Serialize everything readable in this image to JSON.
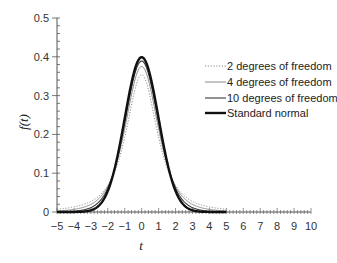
{
  "chart_data": {
    "type": "line",
    "title": "",
    "xlabel": "t",
    "ylabel": "f(t)",
    "xlim": [
      -5,
      10
    ],
    "ylim": [
      0,
      0.5
    ],
    "x_ticks": [
      "-5",
      "-4",
      "-3",
      "-2",
      "-1",
      "0",
      "1",
      "2",
      "3",
      "4",
      "5",
      "6",
      "7",
      "8",
      "9",
      "10"
    ],
    "y_ticks": [
      "0",
      "0.1",
      "0.2",
      "0.3",
      "0.4",
      "0.5"
    ],
    "grid": false,
    "legend_position": "upper right",
    "series": [
      {
        "name": "2 degrees of freedom",
        "style": "dotted",
        "color": "#888888",
        "kind": "t",
        "df": 2,
        "peak": 0.354
      },
      {
        "name": "4 degrees of freedom",
        "style": "solid-thin",
        "color": "#777777",
        "kind": "t",
        "df": 4,
        "peak": 0.375
      },
      {
        "name": "10 degrees of freedom",
        "style": "solid",
        "color": "#444444",
        "kind": "t",
        "df": 10,
        "peak": 0.389
      },
      {
        "name": "Standard normal",
        "style": "solid-thick",
        "color": "#111111",
        "kind": "normal",
        "peak": 0.399
      }
    ],
    "x_range_plotted": [
      -5,
      5
    ]
  },
  "legend": {
    "items": [
      "2 degrees of freedom",
      "4 degrees of freedom",
      "10 degrees of freedom",
      "Standard normal"
    ]
  },
  "axes": {
    "x_title": "t",
    "y_title": "f(t)"
  }
}
